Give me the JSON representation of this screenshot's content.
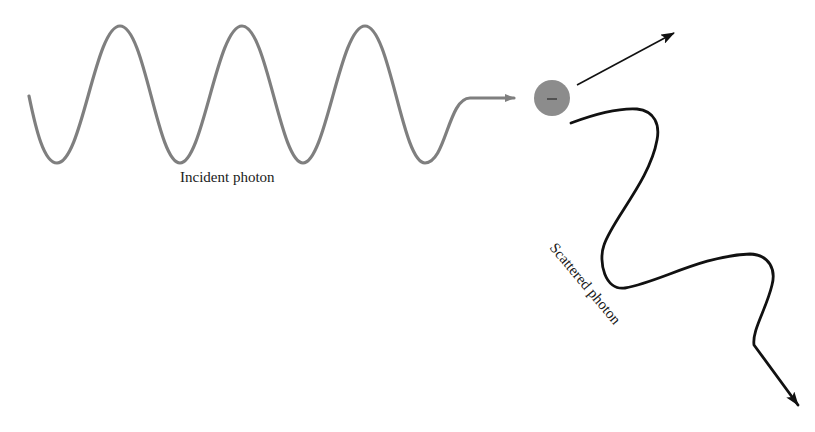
{
  "diagram": {
    "labels": {
      "incident": "Incident photon",
      "scattered": "Scattered photon",
      "electron_charge": "–"
    },
    "colors": {
      "incident_wave": "#7f7f7f",
      "electron": "#8c8c8c",
      "scattered_wave": "#111111",
      "recoil_arrow": "#111111",
      "background": "#ffffff"
    },
    "elements": [
      {
        "id": "incident-photon",
        "type": "sine-wave",
        "cycles": 3.5,
        "direction": "right"
      },
      {
        "id": "electron",
        "type": "circle",
        "charge": "negative"
      },
      {
        "id": "recoil-electron-arrow",
        "type": "arrow",
        "direction": "up-right"
      },
      {
        "id": "scattered-photon",
        "type": "wavy-arrow",
        "direction": "down-right"
      }
    ]
  }
}
